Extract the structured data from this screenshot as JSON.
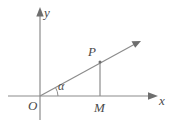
{
  "figure": {
    "kind": "coordinate-geometry-diagram",
    "background_color": "#ffffff",
    "line_color": "#8c8c8c",
    "label_color": "#4a4a4a"
  },
  "axes": {
    "x_label": "x",
    "y_label": "y",
    "origin_label": "O",
    "x_axis": {
      "x1": 8,
      "y1": 96,
      "x2": 158,
      "y2": 96
    },
    "y_axis": {
      "x1": 40,
      "y1": 120,
      "x2": 40,
      "y2": 8
    }
  },
  "points": {
    "P": {
      "label": "P",
      "x": 100,
      "y": 62
    },
    "M": {
      "label": "M",
      "x": 100,
      "y": 96
    },
    "O": {
      "label": "O",
      "x": 40,
      "y": 96
    }
  },
  "ray": {
    "from": {
      "x": 40,
      "y": 96
    },
    "through": {
      "x": 100,
      "y": 62
    },
    "tip": {
      "x": 140,
      "y": 41
    }
  },
  "segment_PM": {
    "from": {
      "x": 100,
      "y": 62
    },
    "to": {
      "x": 100,
      "y": 96
    }
  },
  "angle": {
    "label": "α",
    "vertex": {
      "x": 40,
      "y": 96
    },
    "between": [
      "positive x-axis",
      "ray OP"
    ]
  }
}
